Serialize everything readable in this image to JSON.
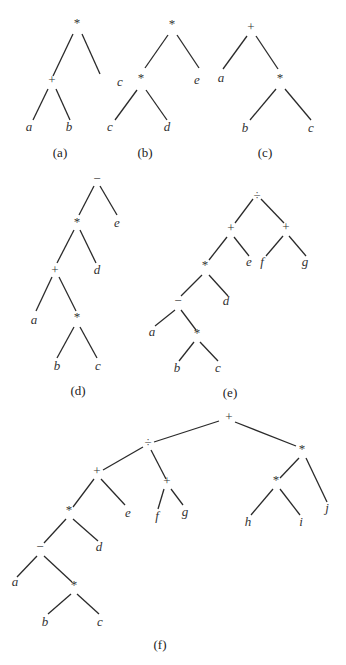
{
  "diagram": {
    "trees": [
      {
        "id": "a",
        "caption": "(a)",
        "caption_pos": [
          60,
          157
        ],
        "nodes": [
          {
            "id": "n0",
            "label": "*",
            "type": "operator",
            "x": 77,
            "y": 27
          },
          {
            "id": "n1",
            "label": "+",
            "type": "operator",
            "x": 52,
            "y": 84
          },
          {
            "id": "n2",
            "label": "c",
            "type": "operand",
            "x": 120,
            "y": 86
          },
          {
            "id": "n3",
            "label": "a",
            "type": "operand",
            "x": 29,
            "y": 131
          },
          {
            "id": "n4",
            "label": "b",
            "type": "operand",
            "x": 69,
            "y": 131
          }
        ],
        "edges": [
          [
            73,
            34,
            53,
            76
          ],
          [
            82,
            34,
            100,
            74
          ],
          [
            48,
            89,
            33,
            120
          ],
          [
            56,
            89,
            70,
            120
          ]
        ]
      },
      {
        "id": "b",
        "caption": "(b)",
        "caption_pos": [
          145,
          157
        ],
        "nodes": [
          {
            "id": "n0",
            "label": "*",
            "type": "operator",
            "x": 172,
            "y": 28
          },
          {
            "id": "n1",
            "label": "*",
            "type": "operator",
            "x": 141,
            "y": 82
          },
          {
            "id": "n2",
            "label": "e",
            "type": "operand",
            "x": 197,
            "y": 84
          },
          {
            "id": "n3",
            "label": "c",
            "type": "operand",
            "x": 110,
            "y": 131
          },
          {
            "id": "n4",
            "label": "d",
            "type": "operand",
            "x": 167,
            "y": 131
          }
        ],
        "edges": [
          [
            168,
            35,
            145,
            68
          ],
          [
            177,
            35,
            199,
            68
          ],
          [
            137,
            90,
            115,
            120
          ],
          [
            146,
            90,
            167,
            120
          ]
        ]
      },
      {
        "id": "c",
        "caption": "(c)",
        "caption_pos": [
          265,
          157
        ],
        "nodes": [
          {
            "id": "n0",
            "label": "+",
            "type": "operator",
            "x": 251,
            "y": 31
          },
          {
            "id": "n1",
            "label": "a",
            "type": "operand",
            "x": 221,
            "y": 82
          },
          {
            "id": "n2",
            "label": "*",
            "type": "operator",
            "x": 280,
            "y": 82
          },
          {
            "id": "n3",
            "label": "b",
            "type": "operand",
            "x": 245,
            "y": 132
          },
          {
            "id": "n4",
            "label": "c",
            "type": "operand",
            "x": 311,
            "y": 132
          }
        ],
        "edges": [
          [
            247,
            36,
            223,
            69
          ],
          [
            256,
            36,
            278,
            69
          ],
          [
            276,
            89,
            250,
            120
          ],
          [
            285,
            89,
            311,
            120
          ]
        ]
      },
      {
        "id": "d",
        "caption": "(d)",
        "caption_pos": [
          78,
          395
        ],
        "nodes": [
          {
            "id": "n0",
            "label": "−",
            "type": "operator",
            "x": 97,
            "y": 183
          },
          {
            "id": "n1",
            "label": "*",
            "type": "operator",
            "x": 77,
            "y": 226
          },
          {
            "id": "n2",
            "label": "e",
            "type": "operand",
            "x": 117,
            "y": 227
          },
          {
            "id": "n3",
            "label": "+",
            "type": "operator",
            "x": 55,
            "y": 274
          },
          {
            "id": "n4",
            "label": "d",
            "type": "operand",
            "x": 97,
            "y": 274
          },
          {
            "id": "n5",
            "label": "a",
            "type": "operand",
            "x": 34,
            "y": 324
          },
          {
            "id": "n6",
            "label": "*",
            "type": "operator",
            "x": 77,
            "y": 321
          },
          {
            "id": "n7",
            "label": "b",
            "type": "operand",
            "x": 57,
            "y": 370
          },
          {
            "id": "n8",
            "label": "c",
            "type": "operand",
            "x": 98,
            "y": 370
          }
        ],
        "edges": [
          [
            94,
            186,
            79,
            215
          ],
          [
            100,
            186,
            117,
            215
          ],
          [
            74,
            230,
            57,
            263
          ],
          [
            80,
            230,
            96,
            263
          ],
          [
            52,
            277,
            36,
            311
          ],
          [
            59,
            277,
            76,
            311
          ],
          [
            74,
            327,
            57,
            358
          ],
          [
            80,
            327,
            97,
            358
          ]
        ]
      },
      {
        "id": "e",
        "caption": "(e)",
        "caption_pos": [
          230,
          397
        ],
        "nodes": [
          {
            "id": "n0",
            "label": "÷",
            "type": "operator",
            "x": 257,
            "y": 199
          },
          {
            "id": "n1",
            "label": "+",
            "type": "operator",
            "x": 231,
            "y": 232
          },
          {
            "id": "n2",
            "label": "+",
            "type": "operator",
            "x": 286,
            "y": 231
          },
          {
            "id": "n3",
            "label": "e",
            "type": "operand",
            "x": 249,
            "y": 266
          },
          {
            "id": "n4",
            "label": "f",
            "type": "operand",
            "x": 262,
            "y": 266
          },
          {
            "id": "n5",
            "label": "g",
            "type": "operand",
            "x": 305,
            "y": 266
          },
          {
            "id": "n6",
            "label": "*",
            "type": "operator",
            "x": 205,
            "y": 269
          },
          {
            "id": "n7",
            "label": "d",
            "type": "operand",
            "x": 226,
            "y": 305
          },
          {
            "id": "n8",
            "label": "−",
            "type": "operator",
            "x": 178,
            "y": 305
          },
          {
            "id": "n9",
            "label": "a",
            "type": "operand",
            "x": 152,
            "y": 336
          },
          {
            "id": "n10",
            "label": "*",
            "type": "operator",
            "x": 197,
            "y": 337
          },
          {
            "id": "n11",
            "label": "b",
            "type": "operand",
            "x": 177,
            "y": 372
          },
          {
            "id": "n12",
            "label": "c",
            "type": "operand",
            "x": 218,
            "y": 372
          }
        ],
        "edges": [
          [
            253,
            199,
            235,
            223
          ],
          [
            261,
            199,
            284,
            223
          ],
          [
            227,
            237,
            209,
            260
          ],
          [
            234,
            237,
            249,
            256
          ],
          [
            283,
            236,
            266,
            256
          ],
          [
            289,
            236,
            306,
            256
          ],
          [
            202,
            275,
            181,
            296
          ],
          [
            209,
            275,
            228,
            296
          ],
          [
            175,
            310,
            155,
            326
          ],
          [
            181,
            310,
            196,
            330
          ],
          [
            194,
            342,
            179,
            361
          ],
          [
            200,
            342,
            218,
            361
          ]
        ]
      },
      {
        "id": "f",
        "caption": "(f)",
        "caption_pos": [
          160,
          649
        ],
        "nodes": [
          {
            "id": "n0",
            "label": "+",
            "type": "operator",
            "x": 229,
            "y": 421
          },
          {
            "id": "n1",
            "label": "÷",
            "type": "operator",
            "x": 148,
            "y": 446
          },
          {
            "id": "n2",
            "label": "*",
            "type": "operator",
            "x": 302,
            "y": 453
          },
          {
            "id": "n3",
            "label": "+",
            "type": "operator",
            "x": 97,
            "y": 475
          },
          {
            "id": "n4",
            "label": "+",
            "type": "operator",
            "x": 167,
            "y": 485
          },
          {
            "id": "n5",
            "label": "*",
            "type": "operator",
            "x": 276,
            "y": 484
          },
          {
            "id": "n6",
            "label": "j",
            "type": "operand",
            "x": 327,
            "y": 512
          },
          {
            "id": "n7",
            "label": "e",
            "type": "operand",
            "x": 128,
            "y": 517
          },
          {
            "id": "n8",
            "label": "f",
            "type": "operand",
            "x": 157,
            "y": 520
          },
          {
            "id": "n9",
            "label": "g",
            "type": "operand",
            "x": 185,
            "y": 516
          },
          {
            "id": "n10",
            "label": "*",
            "type": "operator",
            "x": 69,
            "y": 514
          },
          {
            "id": "n11",
            "label": "h",
            "type": "operand",
            "x": 248,
            "y": 526
          },
          {
            "id": "n12",
            "label": "i",
            "type": "operand",
            "x": 301,
            "y": 526
          },
          {
            "id": "n13",
            "label": "d",
            "type": "operand",
            "x": 99,
            "y": 551
          },
          {
            "id": "n14",
            "label": "−",
            "type": "operator",
            "x": 40,
            "y": 551
          },
          {
            "id": "n15",
            "label": "a",
            "type": "operand",
            "x": 15,
            "y": 586
          },
          {
            "id": "n16",
            "label": "*",
            "type": "operator",
            "x": 74,
            "y": 589
          },
          {
            "id": "n17",
            "label": "b",
            "type": "operand",
            "x": 45,
            "y": 626
          },
          {
            "id": "n18",
            "label": "c",
            "type": "operand",
            "x": 100,
            "y": 626
          }
        ],
        "edges": [
          [
            219,
            421,
            154,
            442
          ],
          [
            235,
            422,
            296,
            446
          ],
          [
            143,
            447,
            103,
            470
          ],
          [
            151,
            450,
            166,
            479
          ],
          [
            299,
            458,
            280,
            478
          ],
          [
            306,
            458,
            327,
            502
          ],
          [
            94,
            479,
            73,
            507
          ],
          [
            101,
            479,
            125,
            505
          ],
          [
            164,
            489,
            158,
            509
          ],
          [
            171,
            489,
            183,
            505
          ],
          [
            273,
            489,
            251,
            515
          ],
          [
            280,
            489,
            300,
            515
          ],
          [
            66,
            519,
            44,
            543
          ],
          [
            73,
            519,
            98,
            541
          ],
          [
            37,
            556,
            17,
            577
          ],
          [
            44,
            556,
            72,
            582
          ],
          [
            71,
            594,
            48,
            614
          ],
          [
            77,
            594,
            99,
            614
          ]
        ]
      }
    ]
  }
}
